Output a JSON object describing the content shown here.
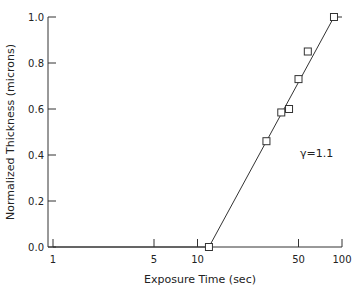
{
  "chart_data": {
    "type": "line",
    "title": "",
    "xlabel": "Exposure Time (sec)",
    "ylabel": "Normalized Thickness (microns)",
    "xscale": "log",
    "xlim": [
      1,
      100
    ],
    "ylim": [
      0.0,
      1.0
    ],
    "grid": false,
    "x_ticks": [
      1,
      5,
      10,
      50,
      100
    ],
    "x_tick_labels": [
      "1",
      "5",
      "10",
      "50",
      "100"
    ],
    "y_ticks": [
      0.0,
      0.2,
      0.4,
      0.6,
      0.8,
      1.0
    ],
    "y_tick_labels": [
      "0.0",
      "0.2",
      "0.4",
      "0.6",
      "0.8",
      "1.0"
    ],
    "series": [
      {
        "name": "measured",
        "marker": "open-square",
        "x": [
          12,
          30,
          38,
          43,
          50,
          58,
          88
        ],
        "y": [
          0.0,
          0.46,
          0.585,
          0.6,
          0.73,
          0.85,
          1.0
        ]
      },
      {
        "name": "fit",
        "marker": "none",
        "x": [
          1,
          12,
          88,
          100
        ],
        "y": [
          0.0,
          0.0,
          1.0,
          1.0
        ]
      }
    ],
    "annotations": [
      {
        "text": "γ=1.1",
        "x": 78,
        "y": 0.4
      }
    ],
    "legend": "none"
  }
}
